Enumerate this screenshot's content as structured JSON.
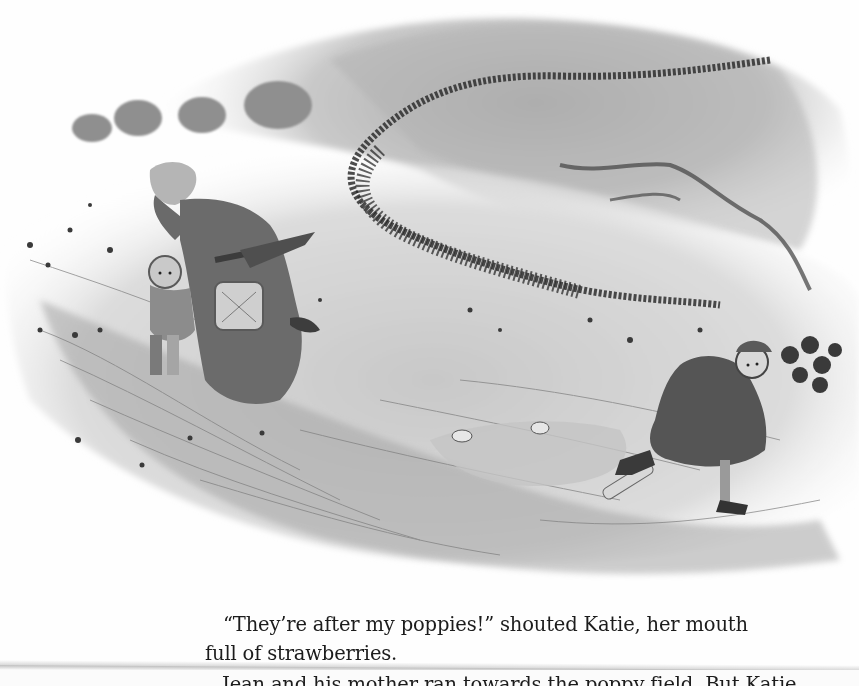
{
  "page": {
    "type": "scanned-book-page",
    "illustration": {
      "description": "Grayscale watercolor: a gust of wind sweeps a dark swarm of poppy petals across a field; a woman in a bonnet with an umbrella and basket shelters a small boy on the left, while a girl clutching a bunch of poppies runs to the right past scattered picnic items",
      "figures": [
        "woman-with-bonnet-and-umbrella",
        "boy-holding-hat",
        "girl-running-with-poppies"
      ],
      "objects": [
        "picnic-basket",
        "umbrella",
        "scattered-picnic-cloth",
        "rolling-pin",
        "teacups",
        "distant-trees",
        "swirling-poppy-swarm"
      ],
      "tones": {
        "paper": "#fefefe",
        "light_wash": "#d4d4d4",
        "mid_wash": "#9a9a9a",
        "dark_ink": "#2a2a2a"
      }
    },
    "text": {
      "lines": [
        "“They’re after my poppies!” shouted Katie, her mouth",
        "full of strawberries.",
        "Jean and his mother ran towards the poppy field. But Katie"
      ]
    }
  }
}
